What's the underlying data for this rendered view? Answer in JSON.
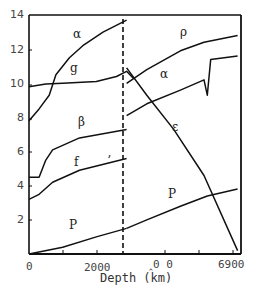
{
  "chart_data": {
    "type": "line",
    "title": "",
    "xlabel": "Depth (km)",
    "ylabel": "",
    "xlim": [
      0,
      6300
    ],
    "ylim": [
      0,
      14
    ],
    "grid": false,
    "y_ticks": [
      "14",
      "12",
      "10",
      "8",
      "6",
      "4",
      "2"
    ],
    "x_ticks": [
      "0",
      "2000",
      "‸0 0",
      "6900"
    ],
    "annotations": [
      {
        "text": "dashed vertical line at core-mantle boundary",
        "x": 2900
      }
    ],
    "series": [
      {
        "name": "α (mantle)",
        "label": "α",
        "points": [
          [
            0,
            7.8
          ],
          [
            300,
            8.5
          ],
          [
            600,
            9.3
          ],
          [
            800,
            10.5
          ],
          [
            1200,
            11.5
          ],
          [
            1600,
            12.2
          ],
          [
            2200,
            13.0
          ],
          [
            2900,
            13.7
          ]
        ]
      },
      {
        "name": "g",
        "label": "g",
        "points": [
          [
            0,
            9.8
          ],
          [
            500,
            9.95
          ],
          [
            1000,
            10.0
          ],
          [
            2000,
            10.1
          ],
          [
            2600,
            10.4
          ],
          [
            2900,
            10.7
          ],
          [
            3100,
            10.3
          ]
        ]
      },
      {
        "name": "β",
        "label": "β",
        "points": [
          [
            0,
            4.5
          ],
          [
            300,
            4.5
          ],
          [
            500,
            5.5
          ],
          [
            700,
            6.1
          ],
          [
            1500,
            6.8
          ],
          [
            2900,
            7.3
          ]
        ]
      },
      {
        "name": "f",
        "label": "f",
        "points": [
          [
            0,
            3.2
          ],
          [
            300,
            3.5
          ],
          [
            700,
            4.2
          ],
          [
            1500,
            4.9
          ],
          [
            2900,
            5.6
          ]
        ]
      },
      {
        "name": "P (mantle)",
        "label": "P",
        "points": [
          [
            0,
            0
          ],
          [
            1000,
            0.4
          ],
          [
            2000,
            1.0
          ],
          [
            2900,
            1.5
          ]
        ]
      },
      {
        "name": "ρ",
        "label": "ρ",
        "points": [
          [
            2900,
            10.0
          ],
          [
            3500,
            10.8
          ],
          [
            4500,
            11.9
          ],
          [
            5200,
            12.4
          ],
          [
            6200,
            12.8
          ]
        ]
      },
      {
        "name": "α (core)",
        "label": "α",
        "points": [
          [
            2900,
            8.1
          ],
          [
            3500,
            8.8
          ],
          [
            4500,
            9.6
          ],
          [
            5200,
            10.2
          ],
          [
            5300,
            9.3
          ],
          [
            5400,
            11.4
          ],
          [
            6200,
            11.6
          ]
        ]
      },
      {
        "name": "ε",
        "label": "ε",
        "points": [
          [
            2900,
            10.9
          ],
          [
            3500,
            9.3
          ],
          [
            4300,
            7.3
          ],
          [
            5200,
            4.6
          ],
          [
            6200,
            0.2
          ]
        ]
      },
      {
        "name": "P (core)",
        "label": "P",
        "points": [
          [
            2900,
            1.5
          ],
          [
            3500,
            2.0
          ],
          [
            4500,
            2.8
          ],
          [
            5300,
            3.4
          ],
          [
            6200,
            3.8
          ]
        ]
      }
    ],
    "curve_labels": [
      {
        "text": "α",
        "x": 77,
        "y": 36
      },
      {
        "text": "g",
        "x": 74,
        "y": 70
      },
      {
        "text": "β",
        "x": 82,
        "y": 124
      },
      {
        "text": "f",
        "x": 78,
        "y": 164
      },
      {
        "text": "ʼ",
        "x": 111,
        "y": 163
      },
      {
        "text": "P",
        "x": 73,
        "y": 227
      },
      {
        "text": "ρ",
        "x": 184,
        "y": 34
      },
      {
        "text": "α",
        "x": 164,
        "y": 76
      },
      {
        "text": "ε",
        "x": 176,
        "y": 129
      },
      {
        "text": "P",
        "x": 172,
        "y": 196
      }
    ]
  }
}
